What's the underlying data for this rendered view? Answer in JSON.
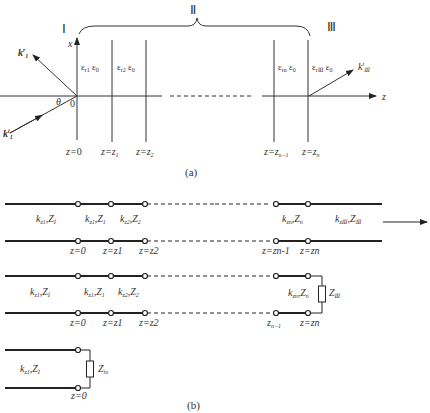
{
  "figure_a": {
    "caption": "(a)",
    "regions": {
      "I": "Ⅰ",
      "II": "Ⅱ",
      "III": "Ⅲ"
    },
    "axes": {
      "x": "x",
      "z": "z",
      "origin": "0",
      "angle": "θ"
    },
    "waves": {
      "incident": "k",
      "incident_sub": "1",
      "incident_sup": "i",
      "reflected": "k",
      "reflected_sub": "1",
      "reflected_sup": "r",
      "transmitted": "k",
      "transmitted_sub": "Ⅲ",
      "transmitted_sup": "t"
    },
    "layers": [
      {
        "eps": "ε",
        "sub": "r1",
        "eps0": "ε",
        "sub0": "0"
      },
      {
        "eps": "ε",
        "sub": "r2",
        "eps0": "ε",
        "sub0": "0"
      },
      {
        "eps": "ε",
        "sub": "rn",
        "eps0": "ε",
        "sub0": "0"
      },
      {
        "eps": "ε",
        "sub": "rⅢ",
        "eps0": "ε",
        "sub0": "0"
      }
    ],
    "boundaries": [
      {
        "lhs": "z",
        "rhs": "0",
        "sub": ""
      },
      {
        "lhs": "z",
        "rhs": "z",
        "sub": "1"
      },
      {
        "lhs": "z",
        "rhs": "z",
        "sub": "2"
      },
      {
        "lhs": "z",
        "rhs": "z",
        "sub": "n−1"
      },
      {
        "lhs": "z",
        "rhs": "z",
        "sub": "n"
      }
    ]
  },
  "figure_b": {
    "caption": "(b)",
    "line1": {
      "sections": [
        {
          "k": "k",
          "ksub": "z1",
          "Z": "Z",
          "Zsub": "Ⅰ"
        },
        {
          "k": "k",
          "ksub": "z1",
          "Z": "Z",
          "Zsub": "1"
        },
        {
          "k": "k",
          "ksub": "z2",
          "Z": "Z",
          "Zsub": "2"
        },
        {
          "k": "k",
          "ksub": "zn",
          "Z": "Z",
          "Zsub": "n"
        },
        {
          "k": "k",
          "ksub": "zⅢ",
          "Z": "Z",
          "Zsub": "Ⅲ"
        }
      ],
      "nodes": [
        "z=0",
        "z=z1",
        "z=z2",
        "z=zn-1",
        "z=zn"
      ]
    },
    "line2": {
      "sections": [
        {
          "k": "k",
          "ksub": "z1",
          "Z": "Z",
          "Zsub": "Ⅰ"
        },
        {
          "k": "k",
          "ksub": "z1",
          "Z": "Z",
          "Zsub": "1"
        },
        {
          "k": "k",
          "ksub": "z2",
          "Z": "Z",
          "Zsub": "2"
        },
        {
          "k": "k",
          "ksub": "zn",
          "Z": "Z",
          "Zsub": "n"
        }
      ],
      "load": {
        "Z": "Z",
        "sub": "Ⅲ"
      }
    },
    "line3": {
      "section": {
        "k": "k",
        "ksub": "z1",
        "Z": "Z",
        "Zsub": "Ⅰ"
      },
      "load": {
        "Z": "Z",
        "sub": "in"
      },
      "node": "z=0"
    }
  }
}
